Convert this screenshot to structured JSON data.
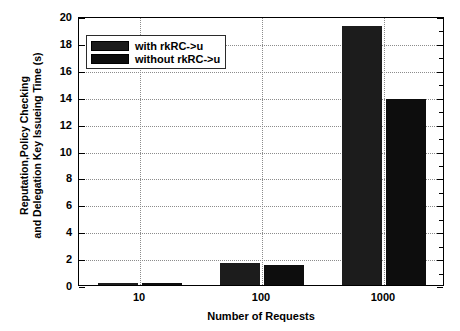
{
  "chart_data": {
    "type": "bar",
    "title": "",
    "xlabel": "Number of Requests",
    "ylabel_line1": "Reputation,Policy Checking",
    "ylabel_line2": "and Delegation Key Issueing Time (s)",
    "categories": [
      "10",
      "100",
      "1000"
    ],
    "series": [
      {
        "name": "with rkRC->u",
        "values": [
          0.15,
          1.6,
          19.25
        ],
        "color": "#1c1c1c"
      },
      {
        "name": "without rkRC->u",
        "values": [
          0.12,
          1.5,
          13.8
        ],
        "color": "#0d0d0d"
      }
    ],
    "ylim": [
      0,
      20
    ],
    "yticks": [
      0,
      2,
      4,
      6,
      8,
      10,
      12,
      14,
      16,
      18,
      20
    ],
    "ytick_labels": [
      "0",
      "2",
      "4",
      "6",
      "8",
      "10",
      "12",
      "14",
      "16",
      "18",
      "20"
    ],
    "grid": true,
    "grid_style": "dotted",
    "grid_color": "#8c8c8c",
    "legend_position": "upper left",
    "axis_color": "#000000",
    "background": "#ffffff"
  }
}
